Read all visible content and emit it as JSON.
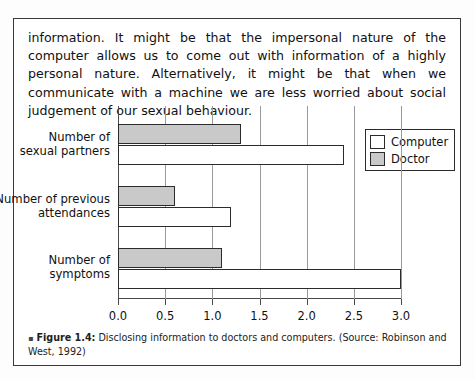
{
  "body_text": {
    "paragraph": "information. It might be that the impersonal nature of the computer allows us to come out with information of a highly personal nature. Alternatively, it might be that when we communicate with a machine we are less worried about social judgement of our sexual behaviour."
  },
  "caption": {
    "bullet": "▪",
    "label": "Figure 1.4:",
    "text": " Disclosing information to doctors and computers. (Source: Robinson and West, 1992)"
  },
  "legend": {
    "position": "top-right",
    "entries": [
      {
        "label": "Computer",
        "color": "#ffffff"
      },
      {
        "label": "Doctor",
        "color": "#c9c9c9"
      }
    ]
  },
  "chart_data": {
    "type": "bar",
    "orientation": "horizontal",
    "title": "",
    "xlabel": "",
    "ylabel": "",
    "xlim": [
      0.0,
      3.0
    ],
    "xticks": [
      "0.0",
      "0.5",
      "1.0",
      "1.5",
      "2.0",
      "2.5",
      "3.0"
    ],
    "xtick_values": [
      0.0,
      0.5,
      1.0,
      1.5,
      2.0,
      2.5,
      3.0
    ],
    "grid": true,
    "categories": [
      "Number of\nsexual partners",
      "Number of previous\nattendances",
      "Number of\nsymptoms"
    ],
    "series": [
      {
        "name": "Doctor",
        "color": "#c9c9c9",
        "values": [
          1.3,
          0.6,
          1.1
        ]
      },
      {
        "name": "Computer",
        "color": "#ffffff",
        "values": [
          2.4,
          1.2,
          3.0
        ]
      }
    ]
  }
}
